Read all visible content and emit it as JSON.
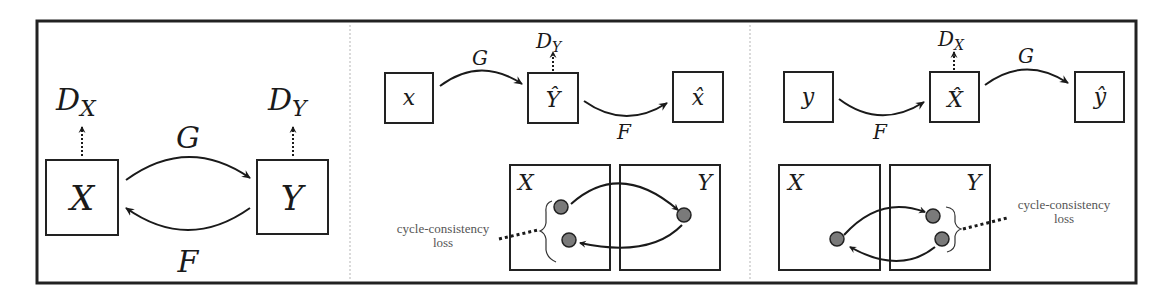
{
  "figure": {
    "panels": [
      {
        "id": "overview",
        "nodes": [
          {
            "label": "X"
          },
          {
            "label": "Y"
          }
        ],
        "mappings": {
          "forward": "G",
          "backward": "F"
        },
        "discriminators": [
          {
            "main": "D",
            "sub": "X"
          },
          {
            "main": "D",
            "sub": "Y"
          }
        ]
      },
      {
        "id": "forward-cycle",
        "chain": [
          {
            "label": "x"
          },
          {
            "label": "Ŷ"
          },
          {
            "label": "x̂"
          }
        ],
        "mappings": {
          "first": "G",
          "second": "F"
        },
        "discriminator": {
          "main": "D",
          "sub": "Y"
        },
        "domains": {
          "left": "X",
          "right": "Y"
        },
        "loss_label": {
          "line1": "cycle-consistency",
          "line2": "loss"
        }
      },
      {
        "id": "backward-cycle",
        "chain": [
          {
            "label": "y"
          },
          {
            "label": "X̂"
          },
          {
            "label": "ŷ"
          }
        ],
        "mappings": {
          "first": "F",
          "second": "G"
        },
        "discriminator": {
          "main": "D",
          "sub": "X"
        },
        "domains": {
          "left": "X",
          "right": "Y"
        },
        "loss_label": {
          "line1": "cycle-consistency",
          "line2": "loss"
        }
      }
    ]
  }
}
